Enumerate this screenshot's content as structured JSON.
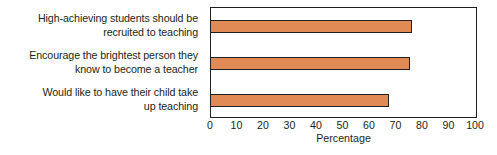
{
  "chart_data": {
    "type": "bar",
    "orientation": "horizontal",
    "title": "",
    "xlabel": "Percentage",
    "ylabel": "",
    "xlim": [
      0,
      100
    ],
    "grid": false,
    "legend": false,
    "categories": [
      "High-achieving students should be\nrecruited to teaching",
      "Encourage the brightest person they\nknow to become a teacher",
      "Would like to have their child take\nup teaching"
    ],
    "values": [
      76,
      75,
      67
    ],
    "xticks": [
      0,
      10,
      20,
      30,
      40,
      50,
      60,
      70,
      80,
      90,
      100
    ],
    "xtick_labels": [
      "0",
      "10",
      "20",
      "30",
      "40",
      "50",
      "60",
      "70",
      "80",
      "90",
      "100"
    ],
    "bar_color": "#e08a55",
    "bar_edge_color": "#231f20",
    "axis_color": "#231f20",
    "background_color": "#ffffff"
  }
}
